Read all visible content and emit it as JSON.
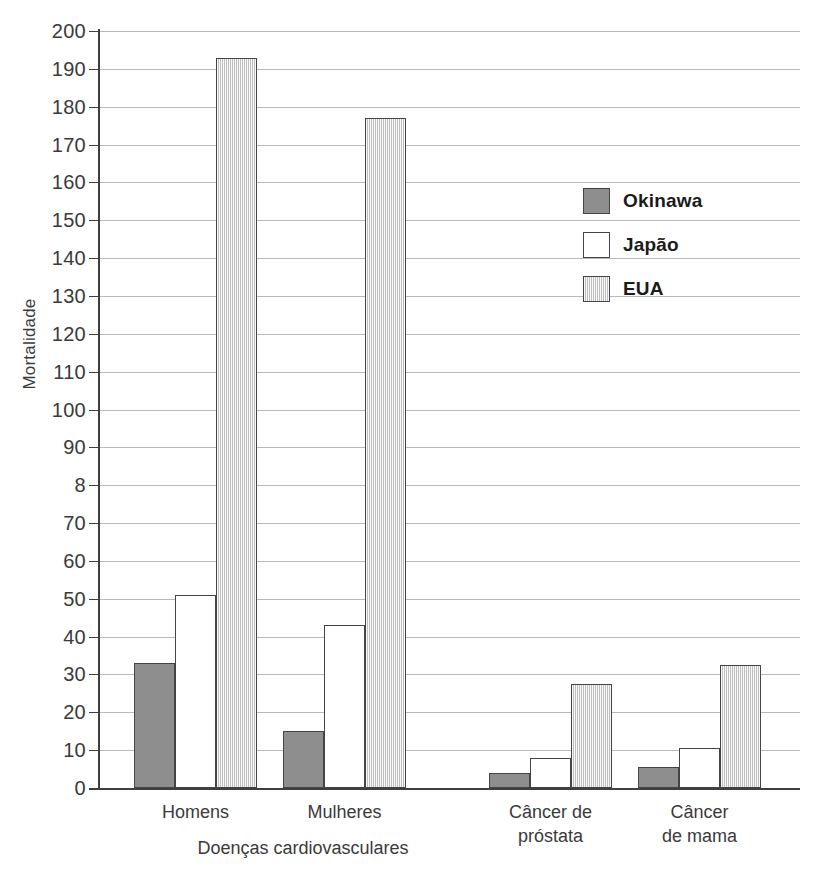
{
  "chart_data": {
    "type": "bar",
    "title": "",
    "xlabel": "Doenças cardiovasculares",
    "ylabel": "Mortalidade",
    "ylim": [
      0,
      200
    ],
    "ytick_values": [
      0,
      10,
      20,
      30,
      40,
      50,
      60,
      70,
      80,
      90,
      100,
      110,
      120,
      130,
      140,
      150,
      160,
      170,
      180,
      190,
      200
    ],
    "ytick_labels": [
      "0",
      "10",
      "20",
      "30",
      "40",
      "50",
      "60",
      "70",
      "8",
      "90",
      "100",
      "110",
      "120",
      "130",
      "140",
      "150",
      "160",
      "170",
      "180",
      "190",
      "200"
    ],
    "grid": true,
    "legend_position": "inside-upper-right",
    "categories": [
      "Homens",
      "Mulheres",
      "Câncer de\npróstata",
      "Câncer\nde mama"
    ],
    "series": [
      {
        "name": "Okinawa",
        "color": "#8e8e8e",
        "values": [
          33,
          15,
          4,
          5.5
        ]
      },
      {
        "name": "Japão",
        "color": "#ffffff",
        "values": [
          51,
          43,
          8,
          10.5
        ]
      },
      {
        "name": "EUA",
        "color": "#dadada",
        "values": [
          193,
          177,
          27.5,
          32.5
        ]
      }
    ]
  },
  "axis": {
    "y_title": "Mortalidade",
    "group_label": "Doenças cardiovasculares"
  },
  "legend": {
    "items": [
      {
        "label": "Okinawa"
      },
      {
        "label": "Japão"
      },
      {
        "label": "EUA"
      }
    ]
  }
}
